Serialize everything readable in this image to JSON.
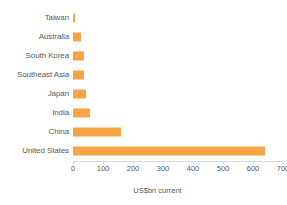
{
  "chart_data": {
    "type": "bar",
    "orientation": "horizontal",
    "title": "",
    "subtitle": "",
    "xlabel": "US$bn current",
    "ylabel": "",
    "categories": [
      "Taiwan",
      "Australia",
      "South Korea",
      "Southeast Asia",
      "Japan",
      "India",
      "China",
      "United States"
    ],
    "values": [
      8,
      25,
      36,
      36,
      43,
      55,
      160,
      640
    ],
    "series": [
      {
        "name": "US$bn current",
        "values": [
          8,
          25,
          36,
          36,
          43,
          55,
          160,
          640
        ],
        "color": "#f5a545"
      }
    ],
    "xlim": [
      0,
      700
    ],
    "xticks": [
      0,
      100,
      200,
      300,
      400,
      500,
      600,
      700
    ],
    "xtick_labels": [
      "0",
      "100",
      "200",
      "300",
      "400",
      "500",
      "600",
      "700"
    ],
    "grid": false,
    "legend": false,
    "legend_position": "none",
    "bar_color": "#f5a545",
    "text_color": "#58595b",
    "axis_color": "#d8d9da",
    "background_color": "#ffffff"
  }
}
